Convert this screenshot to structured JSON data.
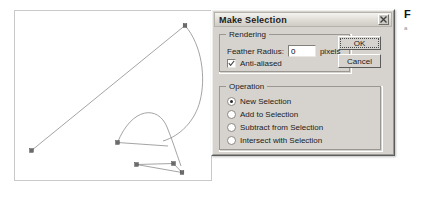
{
  "dialog": {
    "title": "Make Selection",
    "close_icon": "close-icon",
    "rendering": {
      "legend": "Rendering",
      "feather_label": "Feather Radius:",
      "feather_value": "0",
      "feather_placeholder": "0",
      "feather_unit": "pixels",
      "antialias_label": "Anti-aliased",
      "antialias_checked": true,
      "check_icon": "checkmark-icon"
    },
    "operation": {
      "legend": "Operation",
      "options": [
        {
          "label": "New Selection",
          "selected": true
        },
        {
          "label": "Add to Selection",
          "selected": false
        },
        {
          "label": "Subtract from Selection",
          "selected": false
        },
        {
          "label": "Intersect with Selection",
          "selected": false
        }
      ]
    },
    "buttons": {
      "ok": "OK",
      "cancel": "Cancel"
    }
  },
  "caption": {
    "letter": "F",
    "sub": "a"
  },
  "canvas": {
    "name": "path-editing-canvas",
    "description": "Bezier path with anchor points and direction handles"
  },
  "colors": {
    "dialog_face": "#d6d3ce",
    "titlebar": "#e3e0da",
    "path_stroke": "#9a9a9a",
    "anchor_fill": "#6b6b6b",
    "text": "#1b1b1b"
  }
}
